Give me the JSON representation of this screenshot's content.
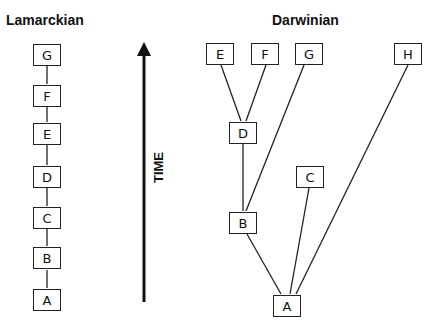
{
  "titles": {
    "left": "Lamarckian",
    "right": "Darwinian"
  },
  "axis": {
    "label": "TIME",
    "direction": "up",
    "color": "#111111"
  },
  "lamarckian": {
    "nodes": [
      {
        "id": "G",
        "label": "G"
      },
      {
        "id": "F",
        "label": "F"
      },
      {
        "id": "E",
        "label": "E"
      },
      {
        "id": "D",
        "label": "D"
      },
      {
        "id": "C",
        "label": "C"
      },
      {
        "id": "B",
        "label": "B"
      },
      {
        "id": "A",
        "label": "A"
      }
    ],
    "edges": [
      [
        "A",
        "B"
      ],
      [
        "B",
        "C"
      ],
      [
        "C",
        "D"
      ],
      [
        "D",
        "E"
      ],
      [
        "E",
        "F"
      ],
      [
        "F",
        "G"
      ]
    ]
  },
  "darwinian": {
    "nodes": [
      {
        "id": "E",
        "label": "E"
      },
      {
        "id": "F",
        "label": "F"
      },
      {
        "id": "G",
        "label": "G"
      },
      {
        "id": "H",
        "label": "H"
      },
      {
        "id": "D",
        "label": "D"
      },
      {
        "id": "C",
        "label": "C"
      },
      {
        "id": "B",
        "label": "B"
      },
      {
        "id": "A",
        "label": "A"
      }
    ],
    "edges": [
      [
        "A",
        "B"
      ],
      [
        "A",
        "C"
      ],
      [
        "A",
        "H"
      ],
      [
        "B",
        "D"
      ],
      [
        "B",
        "G"
      ],
      [
        "D",
        "E"
      ],
      [
        "D",
        "F"
      ]
    ]
  },
  "colors": {
    "line": "#222222",
    "background": "#ffffff"
  }
}
